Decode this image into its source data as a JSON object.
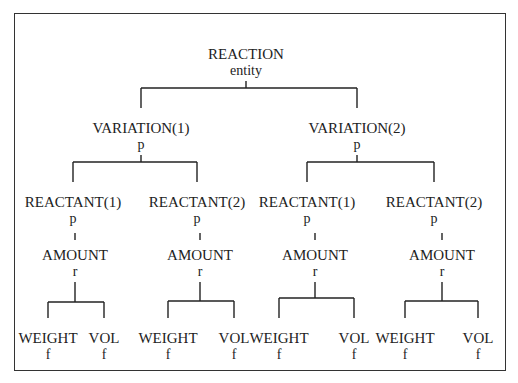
{
  "diagram": {
    "nodes": [
      {
        "id": "reaction",
        "label": "REACTION",
        "type": "entity"
      },
      {
        "id": "var1",
        "label": "VARIATION(1)",
        "type": "p",
        "parent": "reaction"
      },
      {
        "id": "var2",
        "label": "VARIATION(2)",
        "type": "p",
        "parent": "reaction"
      },
      {
        "id": "v1r1",
        "label": "REACTANT(1)",
        "type": "p",
        "parent": "var1"
      },
      {
        "id": "v1r2",
        "label": "REACTANT(2)",
        "type": "p",
        "parent": "var1"
      },
      {
        "id": "v2r1",
        "label": "REACTANT(1)",
        "type": "p",
        "parent": "var2"
      },
      {
        "id": "v2r2",
        "label": "REACTANT(2)",
        "type": "p",
        "parent": "var2"
      },
      {
        "id": "a1",
        "label": "AMOUNT",
        "type": "r",
        "parent": "v1r1"
      },
      {
        "id": "a2",
        "label": "AMOUNT",
        "type": "r",
        "parent": "v1r2"
      },
      {
        "id": "a3",
        "label": "AMOUNT",
        "type": "r",
        "parent": "v2r1"
      },
      {
        "id": "a4",
        "label": "AMOUNT",
        "type": "r",
        "parent": "v2r2"
      },
      {
        "id": "w1",
        "label": "WEIGHT",
        "type": "f",
        "parent": "a1"
      },
      {
        "id": "vo1",
        "label": "VOL",
        "type": "f",
        "parent": "a1"
      },
      {
        "id": "w2",
        "label": "WEIGHT",
        "type": "f",
        "parent": "a2"
      },
      {
        "id": "vo2",
        "label": "VOL",
        "type": "f",
        "parent": "a2"
      },
      {
        "id": "w3",
        "label": "WEIGHT",
        "type": "f",
        "parent": "a3"
      },
      {
        "id": "vo3",
        "label": "VOL",
        "type": "f",
        "parent": "a3"
      },
      {
        "id": "w4",
        "label": "WEIGHT",
        "type": "f",
        "parent": "a4"
      },
      {
        "id": "vo4",
        "label": "VOL",
        "type": "f",
        "parent": "a4"
      }
    ]
  }
}
